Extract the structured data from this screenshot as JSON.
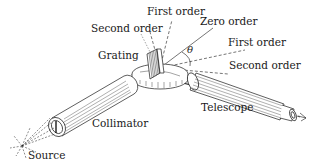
{
  "diagram": {
    "labels": {
      "first_order_left": "First order",
      "second_order_left": "Second order",
      "zero_order": "Zero order",
      "first_order_right": "First order",
      "second_order_right": "Second order",
      "grating": "Grating",
      "telescope": "Telescope",
      "collimator": "Collimator",
      "source": "Source",
      "angle": "θ"
    },
    "components": [
      "Source",
      "Collimator",
      "Grating",
      "Telescope"
    ],
    "colors": {
      "ink": "#1a1a1a",
      "background": "#ffffff"
    }
  }
}
